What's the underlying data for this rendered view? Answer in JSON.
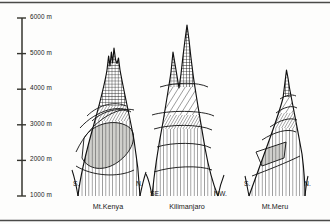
{
  "figure": {
    "type": "profile-diagram",
    "background": "#fdfdfc",
    "ink": "#1a1a1a",
    "frame": {
      "top": true,
      "bottom": true,
      "left": false,
      "right": false
    }
  },
  "axis": {
    "name": "elevation-axis",
    "unit": "m",
    "x_px": 22,
    "top_value": 6000,
    "bottom_value": 1000,
    "top_y_px": 18,
    "bottom_y_px": 196,
    "ticks": [
      {
        "label": "6000 m",
        "value": 6000
      },
      {
        "label": "5000 m",
        "value": 5000
      },
      {
        "label": "4000 m",
        "value": 4000
      },
      {
        "label": "3000 m",
        "value": 3000
      },
      {
        "label": "2000 m",
        "value": 2000
      },
      {
        "label": "1000 m",
        "value": 1000
      }
    ]
  },
  "mountains": [
    {
      "id": "mt-kenya",
      "name": "Mt.Kenya",
      "name_x": 108,
      "name_y": 205,
      "left_direction": "S.",
      "right_direction": "N.",
      "left_dir_x": 73,
      "left_dir_y": 184,
      "right_dir_x": 136,
      "right_dir_y": 184,
      "summit_value": 5200,
      "base_left_value": 1450,
      "base_right_value": 1450
    },
    {
      "id": "kilimanjaro",
      "name": "Kilimanjaro",
      "name_x": 187,
      "name_y": 205,
      "left_direction": "SE.",
      "right_direction": "NW.",
      "left_dir_x": 152,
      "left_dir_y": 194,
      "right_dir_x": 218,
      "right_dir_y": 194,
      "summit_value": 5950,
      "secondary_summit_value": 5150,
      "base_left_value": 1300,
      "base_right_value": 1300
    },
    {
      "id": "mt-meru",
      "name": "Mt.Meru",
      "name_x": 275,
      "name_y": 205,
      "left_direction": "S.",
      "right_direction": "N.",
      "left_dir_x": 243,
      "left_dir_y": 184,
      "right_dir_x": 305,
      "right_dir_y": 184,
      "summit_value": 4550,
      "base_left_value": 1450,
      "base_right_value": 1450
    }
  ],
  "zones": {
    "legend_note": "altitudinal vegetation belts shown by hatch pattern",
    "patterns": [
      {
        "id": "crosshatch",
        "name": "nival-alpine-crosshatch"
      },
      {
        "id": "diagonal",
        "name": "diagonal-hatch-belt"
      },
      {
        "id": "vertical",
        "name": "vertical-hatch-belt"
      },
      {
        "id": "gray",
        "name": "gray-shaded-belt"
      }
    ]
  }
}
